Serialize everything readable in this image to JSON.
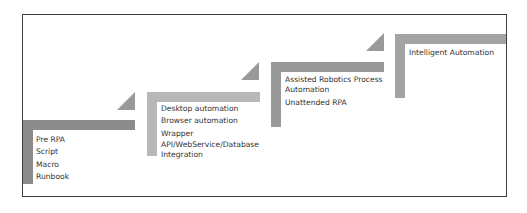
{
  "diagram": {
    "type": "staircase",
    "colors": {
      "step1": "#8c8c8c",
      "step2": "#b8b8b8",
      "step3": "#999999",
      "step4": "#a3a3a3",
      "triangle": "#999999",
      "frame": "#3c3c3c",
      "text": "#333333"
    },
    "stages": [
      {
        "items": [
          "Pre RPA",
          "Script",
          "Macro",
          "Runbook"
        ]
      },
      {
        "items": [
          "Desktop automation",
          "Browser automation",
          "Wrapper",
          "API/WebService/Database Integration"
        ]
      },
      {
        "items": [
          "Assisted Robotics Process Automation",
          "Unattended RPA"
        ]
      },
      {
        "items": [
          "Intelligent Automation"
        ]
      }
    ]
  }
}
